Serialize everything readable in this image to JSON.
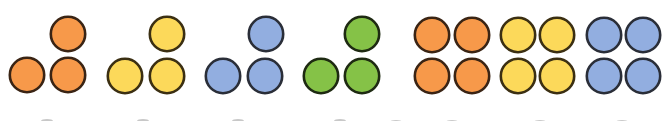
{
  "diagram": {
    "counter_outline_colors": {
      "orange": "#3a2414",
      "yellow": "#3b2f12",
      "blue": "#2a2e38",
      "green": "#1e2a12"
    },
    "colors": {
      "orange": "#f7994a",
      "yellow": "#fcd95a",
      "blue": "#92aee0",
      "green": "#85c247"
    },
    "groups": [
      {
        "id": "orange-triangle",
        "color": "orange",
        "shape": "triangle",
        "count": 3
      },
      {
        "id": "yellow-triangle",
        "color": "yellow",
        "shape": "triangle",
        "count": 3
      },
      {
        "id": "blue-triangle",
        "color": "blue",
        "shape": "triangle",
        "count": 3
      },
      {
        "id": "green-triangle",
        "color": "green",
        "shape": "triangle",
        "count": 3
      },
      {
        "id": "orange-square",
        "color": "orange",
        "shape": "square",
        "count": 4
      },
      {
        "id": "yellow-square",
        "color": "yellow",
        "shape": "square",
        "count": 4
      },
      {
        "id": "blue-square",
        "color": "blue",
        "shape": "square",
        "count": 4
      }
    ],
    "cut_off_row_visible": true
  }
}
